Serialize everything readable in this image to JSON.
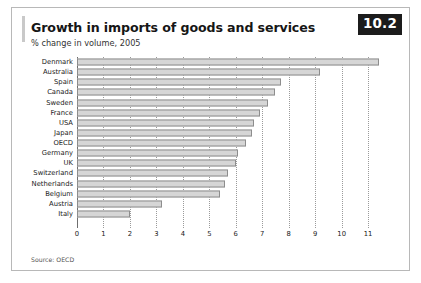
{
  "figure": {
    "badge": "10.2",
    "title": "Growth in imports of goods and services",
    "subtitle": "% change in volume, 2005",
    "source": "Source: OECD"
  },
  "chart_data": {
    "type": "bar",
    "orientation": "horizontal",
    "title": "Growth in imports of goods and services",
    "subtitle": "% change in volume, 2005",
    "xlabel": "",
    "ylabel": "",
    "xlim": [
      0,
      11.6
    ],
    "grid": true,
    "legend": null,
    "source": "Source: OECD",
    "bar_color": "#d6d6d6",
    "bar_edge_color": "#8d8d8d",
    "xticks": [
      0,
      1,
      2,
      3,
      4,
      5,
      6,
      7,
      8,
      9,
      10,
      11
    ],
    "xticklabels": [
      "0",
      "1",
      "2",
      "3",
      "4",
      "5",
      "6",
      "7",
      "8",
      "9",
      "10",
      "11"
    ],
    "categories": [
      "Denmark",
      "Australia",
      "Spain",
      "Canada",
      "Sweden",
      "France",
      "USA",
      "Japan",
      "OECD",
      "Germany",
      "UK",
      "Switzerland",
      "Netherlands",
      "Belgium",
      "Austria",
      "Italy"
    ],
    "values": [
      11.4,
      9.2,
      7.7,
      7.5,
      7.2,
      6.9,
      6.7,
      6.6,
      6.4,
      6.1,
      6.0,
      5.7,
      5.6,
      5.4,
      3.2,
      2.0
    ]
  }
}
